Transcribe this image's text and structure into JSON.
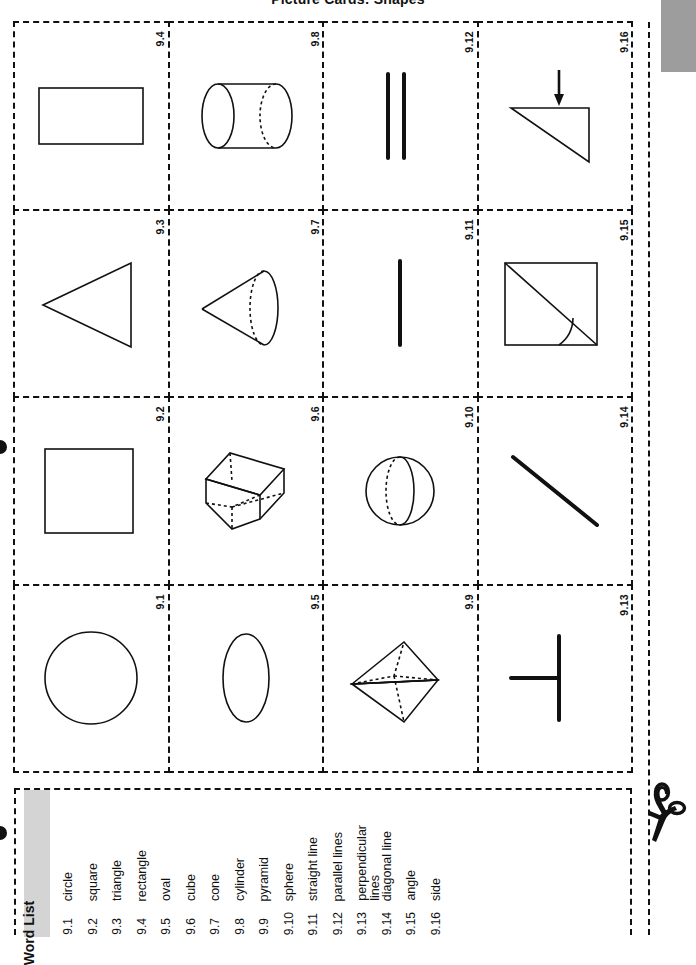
{
  "page": {
    "title": "Picture Cards: Shapes",
    "edge_tab_color": "#9d9d9d",
    "ink_color": "#111111",
    "paper_color": "#ffffff"
  },
  "cards": [
    {
      "label": "9.4",
      "icon": "rectangle-shape"
    },
    {
      "label": "9.8",
      "icon": "cylinder-shape"
    },
    {
      "label": "9.12",
      "icon": "parallel-lines-shape"
    },
    {
      "label": "9.16",
      "icon": "side-arrow-triangle-shape"
    },
    {
      "label": "9.3",
      "icon": "triangle-shape"
    },
    {
      "label": "9.7",
      "icon": "cone-shape"
    },
    {
      "label": "9.11",
      "icon": "straight-line-shape"
    },
    {
      "label": "9.15",
      "icon": "angle-square-diagonal-shape"
    },
    {
      "label": "9.2",
      "icon": "square-shape"
    },
    {
      "label": "9.6",
      "icon": "cube-shape"
    },
    {
      "label": "9.10",
      "icon": "sphere-shape"
    },
    {
      "label": "9.14",
      "icon": "diagonal-line-shape"
    },
    {
      "label": "9.1",
      "icon": "circle-shape"
    },
    {
      "label": "9.5",
      "icon": "oval-shape"
    },
    {
      "label": "9.9",
      "icon": "pyramid-shape"
    },
    {
      "label": "9.13",
      "icon": "perpendicular-lines-shape"
    }
  ],
  "word_list": {
    "header": "Word List",
    "items": [
      {
        "num": "9.1",
        "word": "circle"
      },
      {
        "num": "9.2",
        "word": "square"
      },
      {
        "num": "9.3",
        "word": "triangle"
      },
      {
        "num": "9.4",
        "word": "rectangle"
      },
      {
        "num": "9.5",
        "word": "oval"
      },
      {
        "num": "9.6",
        "word": "cube"
      },
      {
        "num": "9.7",
        "word": "cone"
      },
      {
        "num": "9.8",
        "word": "cylinder"
      },
      {
        "num": "9.9",
        "word": "pyramid"
      },
      {
        "num": "9.10",
        "word": "sphere"
      },
      {
        "num": "9.11",
        "word": "straight line"
      },
      {
        "num": "9.12",
        "word": "parallel lines"
      },
      {
        "num": "9.13",
        "word": "perpendicular\nlines"
      },
      {
        "num": "9.14",
        "word": "diagonal line"
      },
      {
        "num": "9.15",
        "word": "angle"
      },
      {
        "num": "9.16",
        "word": "side"
      }
    ]
  },
  "cut_marker": {
    "icon": "scissors-icon"
  }
}
